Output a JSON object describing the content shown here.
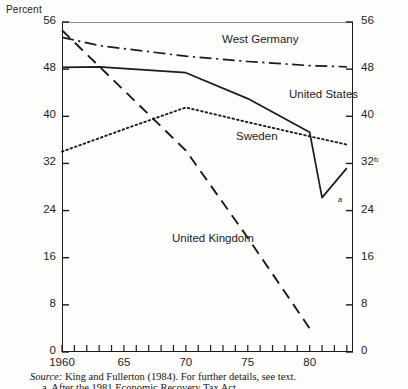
{
  "figure": {
    "y_axis_title": "Percent",
    "source_prefix": "Source:",
    "source_text": "King and Fullerton (1984). For further details, see text.",
    "footnote_text": "a. After the 1981 Economic Recovery Tax Act."
  },
  "annotations": [
    {
      "key": "a",
      "label": "a"
    },
    {
      "key": "b",
      "label": "b"
    }
  ],
  "chart_data": {
    "type": "line",
    "title": "",
    "xlabel": "",
    "ylabel": "Percent",
    "xlim": [
      1960,
      1983.5
    ],
    "ylim": [
      0,
      56
    ],
    "yticks": [
      0,
      8,
      16,
      24,
      32,
      40,
      48,
      56
    ],
    "ytick_labels": [
      "0",
      "8",
      "16",
      "24",
      "32",
      "40",
      "48",
      "56"
    ],
    "ytick_labels_right": [
      "0",
      "8",
      "16",
      "24",
      "32",
      "40",
      "48",
      "56"
    ],
    "xticks": [
      1960,
      1965,
      1970,
      1975,
      1980
    ],
    "xtick_labels": [
      "1960",
      "65",
      "70",
      "75",
      "80"
    ],
    "xtick_minor_step": 1,
    "grid": false,
    "legend": "inline-labels",
    "series": [
      {
        "name": "West Germany",
        "style": "dash-dot",
        "x": [
          1960,
          1963,
          1970,
          1975,
          1980,
          1983
        ],
        "values": [
          53.4,
          52.0,
          50.2,
          49.3,
          48.6,
          48.4
        ]
      },
      {
        "name": "United States",
        "style": "solid",
        "x": [
          1960,
          1963,
          1970,
          1975,
          1980,
          1981,
          1983
        ],
        "values": [
          48.3,
          48.4,
          47.4,
          43.0,
          37.3,
          26.2,
          31.2
        ]
      },
      {
        "name": "Sweden",
        "style": "dotted",
        "x": [
          1960,
          1965,
          1970,
          1975,
          1980,
          1983
        ],
        "values": [
          34.0,
          37.8,
          41.5,
          39.0,
          36.6,
          35.2
        ]
      },
      {
        "name": "United Kingdom",
        "style": "dashed",
        "x": [
          1960,
          1970,
          1975,
          1980
        ],
        "values": [
          54.6,
          34.2,
          19.4,
          4.0
        ]
      }
    ],
    "point_annotations": [
      {
        "label": "a",
        "series": "United States",
        "x": 1981,
        "y": 26.2
      },
      {
        "label": "b",
        "series": "United States",
        "x": 1983,
        "y": 31.2
      }
    ]
  }
}
